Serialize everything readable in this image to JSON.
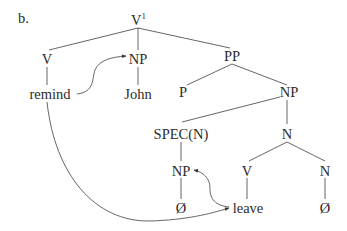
{
  "figure": {
    "label": "b.",
    "type": "syntax-tree",
    "colors": {
      "text": "#2b2b2b",
      "lines": "#555555",
      "background": "#ffffff"
    }
  },
  "nodes": {
    "root": {
      "label": "V",
      "superscript": "1"
    },
    "v": {
      "label": "V"
    },
    "remind": {
      "label": "remind"
    },
    "np_obj": {
      "label": "NP"
    },
    "john": {
      "label": "John"
    },
    "pp": {
      "label": "PP"
    },
    "p": {
      "label": "P"
    },
    "np_pp": {
      "label": "NP"
    },
    "spec": {
      "label": "SPEC(N)"
    },
    "np_spec": {
      "label": "NP"
    },
    "empty_spec": {
      "label": "Ø"
    },
    "n_bar": {
      "label": "N"
    },
    "v_leave": {
      "label": "V"
    },
    "leave": {
      "label": "leave"
    },
    "n_head": {
      "label": "N"
    },
    "empty_n": {
      "label": "Ø"
    }
  },
  "edges": [
    [
      "root",
      "v"
    ],
    [
      "root",
      "np_obj"
    ],
    [
      "root",
      "pp"
    ],
    [
      "v",
      "remind"
    ],
    [
      "np_obj",
      "john"
    ],
    [
      "pp",
      "p"
    ],
    [
      "pp",
      "np_pp"
    ],
    [
      "np_pp",
      "spec"
    ],
    [
      "np_pp",
      "n_bar"
    ],
    [
      "spec",
      "np_spec"
    ],
    [
      "np_spec",
      "empty_spec"
    ],
    [
      "n_bar",
      "v_leave"
    ],
    [
      "n_bar",
      "n_head"
    ],
    [
      "v_leave",
      "leave"
    ],
    [
      "n_head",
      "empty_n"
    ]
  ],
  "movement_arrows": [
    {
      "from": "remind",
      "to": "np_obj"
    },
    {
      "from": "remind",
      "to": "leave"
    },
    {
      "from": "leave",
      "to": "np_spec"
    }
  ]
}
